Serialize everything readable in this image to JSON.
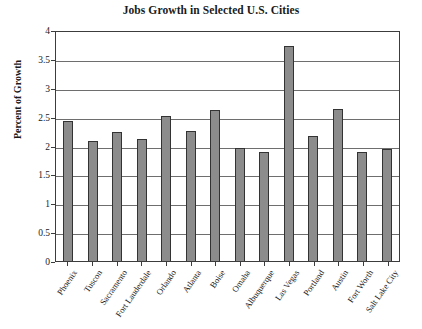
{
  "chart_data": {
    "type": "bar",
    "title": "Jobs Growth in Selected U.S. Cities",
    "xlabel": "",
    "ylabel": "Percent of Growth",
    "ylim": [
      0,
      4
    ],
    "ytick_labels": [
      "4",
      "3.5",
      "3",
      "2.5",
      "2",
      "1.5",
      "1",
      "0.5",
      "0"
    ],
    "ytick_values": [
      4,
      3.5,
      3,
      2.5,
      2,
      1.5,
      1,
      0.5,
      0
    ],
    "grid": true,
    "legend": "none",
    "categories": [
      "Phoenix",
      "Tuscon",
      "Sacramento",
      "Fort Lauderdale",
      "Orlando",
      "Atlanta",
      "Boise",
      "Omaha",
      "Albuquerque",
      "Las Vegas",
      "Portland",
      "Austin",
      "Fort Worth",
      "Salt Lake City"
    ],
    "values": [
      2.42,
      2.08,
      2.24,
      2.12,
      2.51,
      2.25,
      2.62,
      1.96,
      1.89,
      3.72,
      2.17,
      2.63,
      1.88,
      1.94
    ],
    "bar_color": "#8c8c8c",
    "bar_edge_color": "#333333",
    "axis_color": "#3c3c3c",
    "grid_color": "#6e6e6e",
    "text_color": "#1a1a1a"
  }
}
